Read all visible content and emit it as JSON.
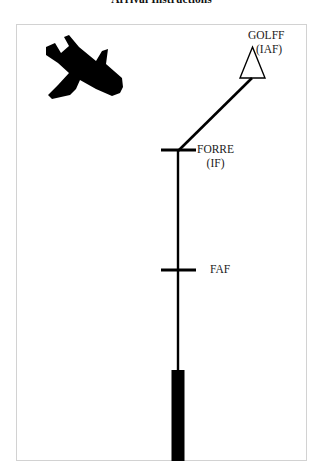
{
  "page": {
    "title": "Arrival Instructions",
    "background_color": "#ffffff",
    "ink_color": "#000000",
    "frame_border_color": "#d2d2d2"
  },
  "diagram": {
    "type": "instrument-approach-procedure-plan-view",
    "aircraft": {
      "icon": "airplane-silhouette-icon",
      "heading": "descending-right",
      "fill": "#000000"
    },
    "waypoints": [
      {
        "id": "golff",
        "name": "GOLFF",
        "qualifier": "(IAF)",
        "symbol": "triangle-outline",
        "x": 252,
        "y": 63
      },
      {
        "id": "forre",
        "name": "FORRE",
        "qualifier": "(IF)",
        "symbol": "cross-tick",
        "x": 178,
        "y": 150
      },
      {
        "id": "faf",
        "name": "FAF",
        "qualifier": "",
        "symbol": "cross-tick",
        "x": 178,
        "y": 270
      }
    ],
    "legs": [
      {
        "from": "golff",
        "to": "forre",
        "style": "solid-thick"
      },
      {
        "from": "forre",
        "to": "runway",
        "style": "solid-thick"
      }
    ],
    "runway": {
      "symbol": "runway-bar",
      "fill": "#000000",
      "x": 178,
      "y_top": 370,
      "y_bottom": 461
    }
  }
}
